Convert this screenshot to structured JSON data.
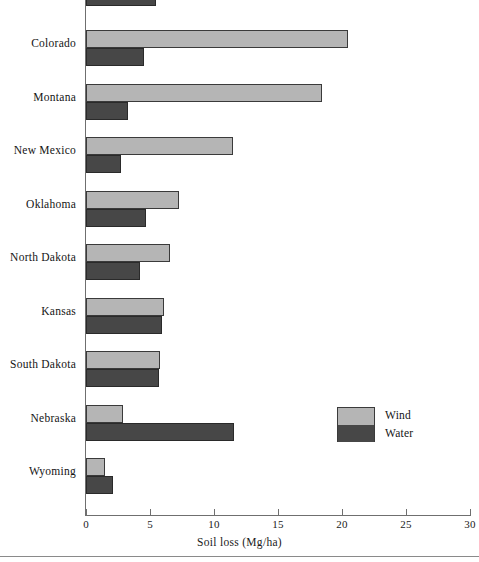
{
  "chart_data": {
    "type": "bar",
    "orientation": "horizontal",
    "title": "",
    "xlabel": "Soil loss (Mg/ha)",
    "ylabel": "",
    "xlim": [
      0,
      30
    ],
    "xticks": [
      0,
      5,
      10,
      15,
      20,
      25,
      30
    ],
    "xtick_labels": [
      "0",
      "5",
      "10",
      "15",
      "20",
      "25",
      "30"
    ],
    "grid": false,
    "legend_position": "right-inside",
    "categories": [
      "Colorado",
      "Montana",
      "New Mexico",
      "Oklahoma",
      "North Dakota",
      "Kansas",
      "South Dakota",
      "Nebraska",
      "Wyoming"
    ],
    "series": [
      {
        "name": "Wind",
        "color": "#b5b5b5",
        "values": [
          20.5,
          18.4,
          11.5,
          7.3,
          6.6,
          6.1,
          5.8,
          2.9,
          1.5
        ]
      },
      {
        "name": "Water",
        "color": "#474747",
        "values": [
          4.5,
          3.3,
          2.7,
          4.7,
          4.2,
          5.9,
          5.7,
          11.6,
          2.1
        ]
      }
    ],
    "clipped_top_row": {
      "series": "Water",
      "value": 5.5,
      "note": "partial bar cut off at top edge"
    }
  },
  "axis": {
    "title": "Soil loss (Mg/ha)"
  },
  "legend": {
    "wind_label": "Wind",
    "water_label": "Water"
  }
}
